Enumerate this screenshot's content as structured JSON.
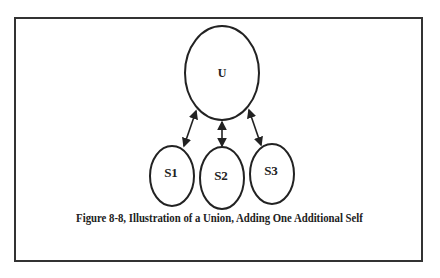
{
  "diagram": {
    "nodes": [
      {
        "id": "U",
        "label": "U"
      },
      {
        "id": "S1",
        "label": "S1"
      },
      {
        "id": "S2",
        "label": "S2"
      },
      {
        "id": "S3",
        "label": "S3"
      }
    ],
    "edges": [
      {
        "from": "U",
        "to": "S1",
        "type": "bidirectional"
      },
      {
        "from": "U",
        "to": "S2",
        "type": "bidirectional"
      },
      {
        "from": "U",
        "to": "S3",
        "type": "bidirectional"
      }
    ],
    "caption": "Figure 8-8, Illustration of a Union, Adding One Additional Self"
  }
}
